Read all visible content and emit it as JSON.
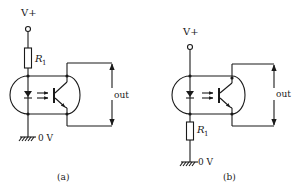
{
  "figure": {
    "type": "optocoupler circuit diagrams",
    "panels": [
      {
        "id": "a",
        "caption": "(a)",
        "supply_label": "V+",
        "resistor_label": "R",
        "resistor_subscript": "1",
        "resistor_position": "between V+ and LED (high side)",
        "ground_label": "0 V",
        "output_label": "out"
      },
      {
        "id": "b",
        "caption": "(b)",
        "supply_label": "V+",
        "resistor_label": "R",
        "resistor_subscript": "1",
        "resistor_position": "between LED and ground (low side)",
        "ground_label": "0 V",
        "output_label": "out"
      }
    ]
  }
}
